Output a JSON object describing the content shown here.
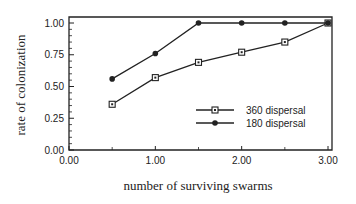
{
  "chart_data": {
    "type": "line",
    "title": "",
    "xlabel": "number of surviving swarms",
    "ylabel": "rate of colonization",
    "xlim": [
      0,
      3
    ],
    "ylim": [
      0,
      1
    ],
    "xticks": [
      "0.00",
      "1.00",
      "2.00",
      "3.00"
    ],
    "yticks": [
      "0.00",
      "0.25",
      "0.50",
      "0.75",
      "1.00"
    ],
    "grid": false,
    "legend_position": "lower right (inside)",
    "series": [
      {
        "name": "360 dispersal",
        "marker": "open-square",
        "x": [
          0.5,
          1.0,
          1.5,
          2.0,
          2.5,
          3.0
        ],
        "values": [
          0.36,
          0.57,
          0.69,
          0.77,
          0.85,
          1.0
        ]
      },
      {
        "name": "180 dispersal",
        "marker": "filled-dot",
        "x": [
          0.5,
          1.0,
          1.5,
          2.0,
          2.5,
          3.0
        ],
        "values": [
          0.56,
          0.76,
          1.0,
          1.0,
          1.0,
          1.0
        ]
      }
    ]
  },
  "colors": {
    "line": "#222222",
    "background": "#ffffff"
  }
}
